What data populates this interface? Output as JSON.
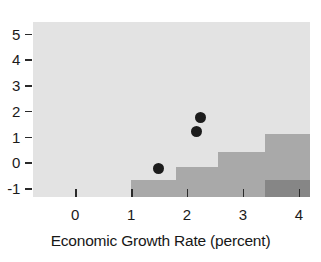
{
  "chart_data": {
    "type": "scatter",
    "title": "",
    "xlabel": "Economic Growth Rate (percent)",
    "ylabel": "",
    "xlim": [
      -0.75,
      4.2
    ],
    "ylim": [
      -1.35,
      5.45
    ],
    "xticks": [
      "0",
      "1",
      "2",
      "3",
      "4"
    ],
    "xtick_values": [
      0,
      1,
      2,
      3,
      4
    ],
    "yticks": [
      "5",
      "4",
      "3",
      "2",
      "1",
      "0",
      "-1"
    ],
    "ytick_values": [
      5,
      4,
      3,
      2,
      1,
      0,
      -1
    ],
    "grid": false,
    "legend": null,
    "points": [
      {
        "x": 2.25,
        "y": 1.75
      },
      {
        "x": 2.17,
        "y": 1.2
      },
      {
        "x": 1.5,
        "y": -0.25
      }
    ],
    "shaded_steps": [
      {
        "x_start": 1.0,
        "x_end": 1.8,
        "y_top": -0.7
      },
      {
        "x_start": 1.8,
        "x_end": 2.55,
        "y_top": -0.2
      },
      {
        "x_start": 2.55,
        "x_end": 3.4,
        "y_top": 0.4
      },
      {
        "x_start": 3.4,
        "x_end": 4.2,
        "y_top": 1.1
      }
    ],
    "dark_region": {
      "x_start": 3.4,
      "x_end": 4.2,
      "y_top": -0.7,
      "y_bottom": -1.35
    },
    "colors": {
      "panel_background": "#e3e3e3",
      "step_shading": "#a9a9a9",
      "dark_shading": "#868686",
      "point": "#1c1c1c",
      "axis_text": "#1a1a1a"
    }
  }
}
